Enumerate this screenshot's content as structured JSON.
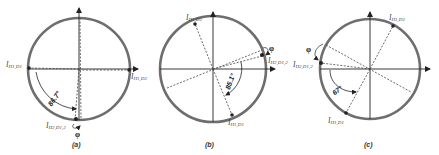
{
  "figure": {
    "panels": [
      {
        "caption": "(a)",
        "angle_label": "86.7°",
        "phi_label": "φ",
        "labels": {
          "h1_d1": {
            "main": "I",
            "sub": "H1,D1"
          },
          "h1_d2": {
            "main": "I",
            "sub": "H1,D2"
          },
          "h2_d12": {
            "main": "I",
            "sub": "H2,D1,2"
          }
        }
      },
      {
        "caption": "(b)",
        "angle_label": "85.1°",
        "phi_label": "φ",
        "labels": {
          "h1_d1": {
            "main": "I",
            "sub": "H1,D1"
          },
          "h1_d2": {
            "main": "I",
            "sub": "H1,D2"
          },
          "h2_d12": {
            "main": "I",
            "sub": "H2,D1,2"
          }
        }
      },
      {
        "caption": "(c)",
        "angle_label": "67°",
        "phi_label": "φ",
        "labels": {
          "h1_d1": {
            "main": "I",
            "sub": "H1,D1"
          },
          "h1_d2": {
            "main": "I",
            "sub": "H1,D2"
          },
          "h2_d12": {
            "main": "I",
            "sub": "H2,D1,2"
          }
        }
      }
    ],
    "colors": {
      "circle": "#6a6a6a",
      "axis": "#222222",
      "dashed": "#444444"
    }
  }
}
